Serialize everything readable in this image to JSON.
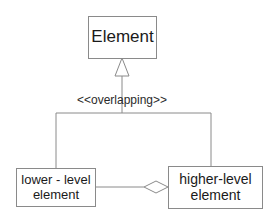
{
  "diagram": {
    "type": "uml-class",
    "nodes": {
      "element": {
        "label": "Element"
      },
      "lower": {
        "line1": "lower - level",
        "line2": "element"
      },
      "higher": {
        "line1": "higher-level",
        "line2": "element"
      }
    },
    "generalization": {
      "stereotype": "<<overlapping>>",
      "parent": "Element",
      "children": [
        "lower - level element",
        "higher-level element"
      ]
    },
    "aggregation": {
      "whole": "higher-level element",
      "part": "lower - level element"
    },
    "colors": {
      "line": "#8a8a8a",
      "text": "#1a1a1a",
      "background": "#ffffff"
    }
  }
}
